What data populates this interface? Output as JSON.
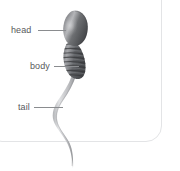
{
  "diagram": {
    "frame": {
      "shape": "rounded-rectangle",
      "border_color": "#e3e4e6",
      "background_color": "#ffffff"
    },
    "labels": [
      {
        "id": "head",
        "text": "head",
        "target": "sperm-head",
        "leader": true
      },
      {
        "id": "body",
        "text": "body",
        "target": "sperm-body",
        "leader": true
      },
      {
        "id": "tail",
        "text": "tail",
        "target": "sperm-tail",
        "leader": true
      }
    ],
    "label_color": "#58595b",
    "leader_color": "#8a8c8f",
    "parts": [
      {
        "name": "head",
        "description": "oval teardrop acrosome cap, darkest shading",
        "fill_dark": "#4c4d50",
        "fill_light": "#b6b7ba"
      },
      {
        "name": "body",
        "description": "segmented midpiece with ridged bands",
        "fill_dark": "#55565a",
        "fill_light": "#a9aaad",
        "segment_count": 8
      },
      {
        "name": "tail",
        "description": "long wavy flagellum tapering to a point, extends past frame",
        "fill_dark": "#8e9094",
        "fill_light": "#dedfe1"
      }
    ]
  }
}
